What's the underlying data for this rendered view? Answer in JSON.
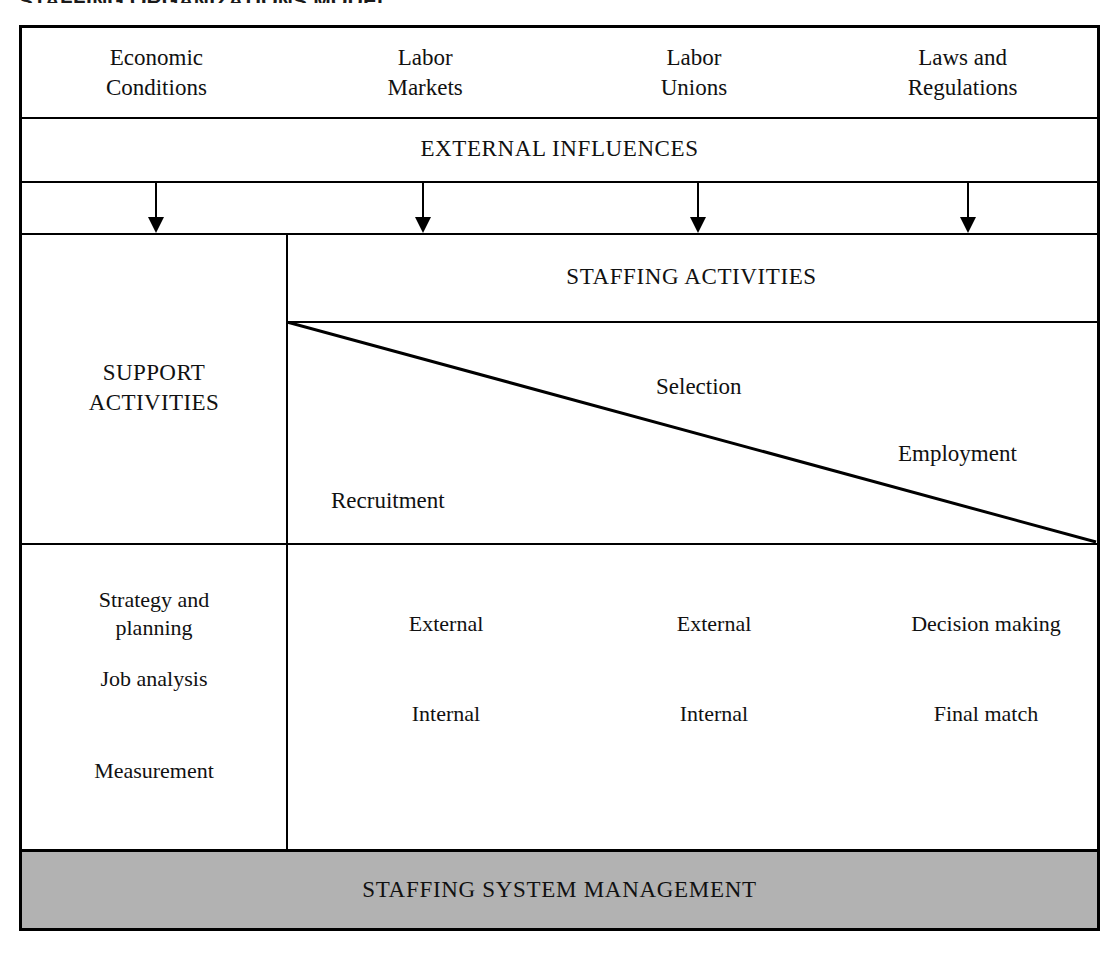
{
  "figure": {
    "title": "STAFFING ORGANIZATIONS MODEL"
  },
  "external_factors": [
    {
      "line1": "Economic",
      "line2": "Conditions"
    },
    {
      "line1": "Labor",
      "line2": "Markets"
    },
    {
      "line1": "Labor",
      "line2": "Unions"
    },
    {
      "line1": "Laws and",
      "line2": "Regulations"
    }
  ],
  "bands": {
    "external_influences": "EXTERNAL INFLUENCES",
    "staffing_activities": "STAFFING ACTIVITIES",
    "staffing_system_management": "STAFFING SYSTEM MANAGEMENT"
  },
  "support": {
    "heading_line1": "SUPPORT",
    "heading_line2": "ACTIVITIES",
    "items": [
      {
        "line1": "Strategy and",
        "line2": "planning"
      },
      {
        "line1": "Job analysis",
        "line2": ""
      },
      {
        "line1": "Measurement",
        "line2": ""
      }
    ]
  },
  "staffing": {
    "phases": [
      {
        "label": "Recruitment"
      },
      {
        "label": "Selection"
      },
      {
        "label": "Employment"
      }
    ],
    "grid": {
      "row1": [
        "External",
        "External",
        "Decision making"
      ],
      "row2": [
        "Internal",
        "Internal",
        "Final match"
      ]
    }
  },
  "arrows": {
    "count": 4,
    "icon": "down-arrow-icon"
  },
  "colors": {
    "line": "#000000",
    "management_band_fill": "#b2b2b2",
    "page_background": "#ffffff",
    "text": "#111111"
  }
}
